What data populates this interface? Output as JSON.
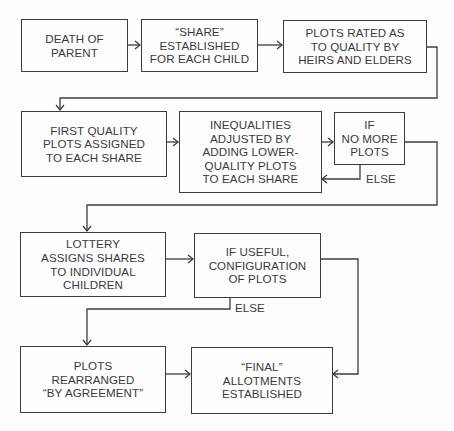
{
  "diagram": {
    "type": "flowchart",
    "colors": {
      "line": "#3c3c3c",
      "text": "#3a3a3a",
      "background": "#fdfdfd"
    },
    "nodes": [
      {
        "id": "death-of-parent",
        "text": "DEATH OF\nPARENT"
      },
      {
        "id": "share-established",
        "text": "“SHARE”\nESTABLISHED\nFOR EACH CHILD"
      },
      {
        "id": "plots-rated",
        "text": "PLOTS RATED AS\nTO QUALITY BY\nHEIRS AND ELDERS"
      },
      {
        "id": "first-quality-plots",
        "text": "FIRST QUALITY\nPLOTS ASSIGNED\nTO EACH SHARE"
      },
      {
        "id": "inequalities-adjusted",
        "text": "INEQUALITIES\nADJUSTED BY\nADDING LOWER-\nQUALITY PLOTS\nTO EACH SHARE"
      },
      {
        "id": "if-no-more-plots",
        "text": "IF\nNO MORE\nPLOTS"
      },
      {
        "id": "lottery-assigns",
        "text": "LOTTERY\nASSIGNS SHARES\nTO INDIVIDUAL\nCHILDREN"
      },
      {
        "id": "if-useful-configuration",
        "text": "IF USEFUL,\nCONFIGURATION\nOF PLOTS"
      },
      {
        "id": "plots-rearranged",
        "text": "PLOTS\nREARRANGED\n“BY AGREEMENT”"
      },
      {
        "id": "final-allotments",
        "text": "“FINAL”\nALLOTMENTS\nESTABLISHED"
      }
    ],
    "edge_labels": {
      "else_1": "ELSE",
      "else_2": "ELSE"
    },
    "edges": [
      {
        "from": "death-of-parent",
        "to": "share-established"
      },
      {
        "from": "share-established",
        "to": "plots-rated"
      },
      {
        "from": "plots-rated",
        "to": "first-quality-plots"
      },
      {
        "from": "first-quality-plots",
        "to": "inequalities-adjusted"
      },
      {
        "from": "inequalities-adjusted",
        "to": "if-no-more-plots"
      },
      {
        "from": "if-no-more-plots",
        "to": "inequalities-adjusted",
        "label": "ELSE"
      },
      {
        "from": "if-no-more-plots",
        "to": "lottery-assigns"
      },
      {
        "from": "lottery-assigns",
        "to": "if-useful-configuration"
      },
      {
        "from": "if-useful-configuration",
        "to": "final-allotments"
      },
      {
        "from": "if-useful-configuration",
        "to": "plots-rearranged",
        "label": "ELSE"
      },
      {
        "from": "plots-rearranged",
        "to": "final-allotments"
      }
    ]
  }
}
